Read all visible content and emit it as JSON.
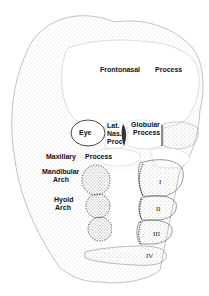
{
  "diagram": {
    "labels": {
      "frontonasal": "Frontonasal",
      "frontonasal_process": "Process",
      "eye": "Eye",
      "lat": "Lat.",
      "nas": "Nas.",
      "proc": "Proc",
      "globular": "Globular",
      "globular_process": "Process",
      "maxillary": "Maxillary",
      "maxillary_process": "Process",
      "mandibular": "Mandibular",
      "mandibular_arch": "Arch",
      "hyoid": "Hyoid",
      "hyoid_arch": "Arch"
    },
    "arches": [
      "I",
      "II",
      "III",
      "IV"
    ],
    "colors": {
      "ink": "#111111",
      "stipple": "#555555",
      "background": "#ffffff"
    }
  }
}
